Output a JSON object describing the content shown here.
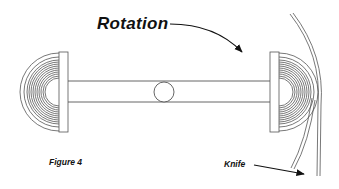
{
  "labels": {
    "rotation": "Rotation",
    "figure": "Figure 4",
    "knife": "Knife"
  },
  "colors": {
    "line": "#555555",
    "arrow": "#111111",
    "background": "#ffffff"
  },
  "diagram": {
    "components": [
      {
        "name": "left-roll",
        "ring_count": 12
      },
      {
        "name": "axle-shaft"
      },
      {
        "name": "center-hub-circle"
      },
      {
        "name": "right-roll",
        "ring_count": 12
      },
      {
        "name": "material-web"
      },
      {
        "name": "knife-blade"
      }
    ]
  }
}
